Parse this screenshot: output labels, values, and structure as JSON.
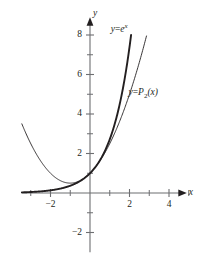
{
  "figure": {
    "background": "#ffffff",
    "ink": "#231f20",
    "axis_color": "#6d6e71"
  },
  "axes": {
    "x_label": "x",
    "y_label": "y",
    "x_ticks_major": [
      {
        "value": -2,
        "label": "−2"
      },
      {
        "value": 2,
        "label": "2"
      },
      {
        "value": 4,
        "label": "4"
      }
    ],
    "x_ticks_minor": [
      -3,
      -1,
      1,
      3,
      5
    ],
    "y_ticks_major": [
      {
        "value": 8,
        "label": "8"
      },
      {
        "value": 6,
        "label": "6"
      },
      {
        "value": 4,
        "label": "4"
      },
      {
        "value": 2,
        "label": "2"
      },
      {
        "value": -2,
        "label": "−2"
      }
    ],
    "y_ticks_minor": [
      1,
      3,
      5,
      7,
      -1
    ]
  },
  "labels": {
    "exp_curve": {
      "lhs": "y",
      "eq": "=",
      "base": "e",
      "exponent": "x"
    },
    "poly_curve": {
      "lhs": "y",
      "eq": "=",
      "name": "P",
      "index": "2",
      "arg": "(x)"
    }
  },
  "chart_data": {
    "type": "line",
    "title": "",
    "xlabel": "x",
    "ylabel": "y",
    "xlim": [
      -3.45,
      4.85
    ],
    "ylim": [
      -3.0,
      8.85
    ],
    "grid": false,
    "legend": "inline-annotations",
    "series": [
      {
        "name": "y = e^x",
        "expression": "exp(x)",
        "linewidth": 1.9,
        "color": "#231f20",
        "x_start": -3.45,
        "x_end": 2.0794,
        "annotation": "y = e^x",
        "annotation_at": [
          1.05,
          8.35
        ],
        "points": [
          {
            "x": -3.45,
            "y": 0.032
          },
          {
            "x": -3.0,
            "y": 0.05
          },
          {
            "x": -2.5,
            "y": 0.082
          },
          {
            "x": -2.0,
            "y": 0.135
          },
          {
            "x": -1.5,
            "y": 0.223
          },
          {
            "x": -1.0,
            "y": 0.368
          },
          {
            "x": -0.5,
            "y": 0.607
          },
          {
            "x": 0.0,
            "y": 1.0
          },
          {
            "x": 0.5,
            "y": 1.649
          },
          {
            "x": 1.0,
            "y": 2.718
          },
          {
            "x": 1.5,
            "y": 4.482
          },
          {
            "x": 2.0,
            "y": 7.389
          },
          {
            "x": 2.0794,
            "y": 8.0
          }
        ]
      },
      {
        "name": "y = P2(x)",
        "expression": "1 + x + x^2/2",
        "linewidth": 0.9,
        "color": "#231f20",
        "x_start": -3.45,
        "x_end": 2.86,
        "annotation": "y = P_2(x)",
        "annotation_at": [
          1.95,
          5.05
        ],
        "points": [
          {
            "x": -3.45,
            "y": 3.501
          },
          {
            "x": -3.0,
            "y": 2.5
          },
          {
            "x": -2.5,
            "y": 1.625
          },
          {
            "x": -2.0,
            "y": 1.0
          },
          {
            "x": -1.5,
            "y": 0.625
          },
          {
            "x": -1.0,
            "y": 0.5
          },
          {
            "x": -0.5,
            "y": 0.625
          },
          {
            "x": 0.0,
            "y": 1.0
          },
          {
            "x": 0.5,
            "y": 1.625
          },
          {
            "x": 1.0,
            "y": 2.5
          },
          {
            "x": 1.5,
            "y": 3.625
          },
          {
            "x": 2.0,
            "y": 5.0
          },
          {
            "x": 2.5,
            "y": 6.625
          },
          {
            "x": 2.86,
            "y": 7.95
          }
        ]
      }
    ],
    "annotations": [
      {
        "text": "y = e^x",
        "x": 1.05,
        "y": 8.35
      },
      {
        "text": "y = P_2(x)",
        "x": 1.95,
        "y": 5.05
      }
    ]
  }
}
